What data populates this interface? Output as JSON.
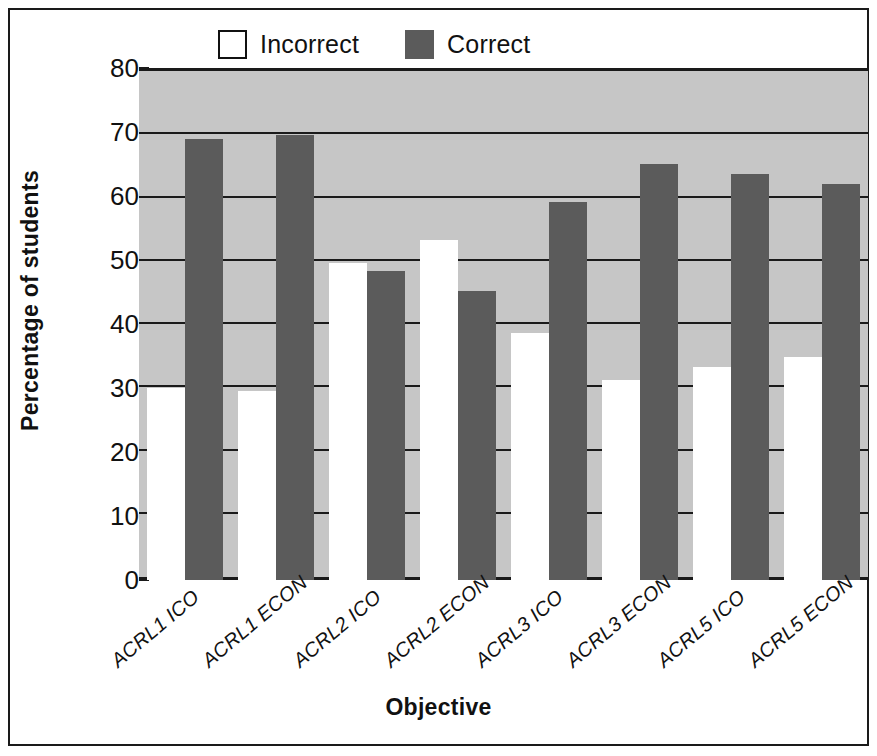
{
  "chart_data": {
    "type": "bar",
    "title": "",
    "xlabel": "Objective",
    "ylabel": "Percentage of students",
    "ylim": [
      0,
      80
    ],
    "yticks": [
      0,
      10,
      20,
      30,
      40,
      50,
      60,
      70,
      80
    ],
    "grid": true,
    "legend_position": "top",
    "categories": [
      "ACRL1 ICO",
      "ACRL1 ECON",
      "ACRL2 ICO",
      "ACRL2 ECON",
      "ACRL3 ICO",
      "ACRL3 ECON",
      "ACRL5 ICO",
      "ACRL5 ECON"
    ],
    "series": [
      {
        "name": "Incorrect",
        "color": "#ffffff",
        "values": [
          30.0,
          29.6,
          49.6,
          53.2,
          38.6,
          31.2,
          33.3,
          34.8
        ]
      },
      {
        "name": "Correct",
        "color": "#5b5b5b",
        "values": [
          68.9,
          69.5,
          48.3,
          45.1,
          59.0,
          65.0,
          63.4,
          61.8
        ]
      }
    ]
  },
  "legend": {
    "items": [
      {
        "label": "Incorrect",
        "swatch": "white-square-outline"
      },
      {
        "label": "Correct",
        "swatch": "dark-gray-square"
      }
    ]
  },
  "axes": {
    "y_title": "Percentage of students",
    "x_title": "Objective"
  },
  "colors": {
    "plot_background": "#c6c6c6",
    "axis": "#1a1a1a",
    "incorrect_bar": "#ffffff",
    "correct_bar": "#5b5b5b",
    "page_background": "#ffffff"
  }
}
